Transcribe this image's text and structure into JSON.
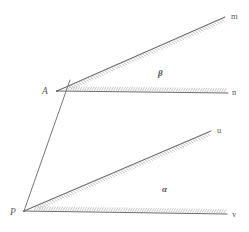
{
  "figure": {
    "kind": "geometry-diagram",
    "background_color": "#ffffff",
    "line_color": "#6d6d70",
    "hatch_color": "#a9a9ad",
    "label_color": "#5c5c60",
    "width": 249,
    "height": 232
  },
  "angles": [
    {
      "id": "upper-angle",
      "name": "beta",
      "label": "β",
      "label_x": 158,
      "label_y": 76,
      "vertex": {
        "label": "A",
        "label_x": 42,
        "label_y": 94,
        "x": 57,
        "y": 91
      },
      "rays": [
        {
          "id": "ray-am",
          "label": "m",
          "label_x": 231,
          "label_y": 19,
          "from_x": 57,
          "from_y": 91,
          "to_x": 225,
          "to_y": 17
        },
        {
          "id": "ray-an",
          "label": "n",
          "label_x": 232,
          "label_y": 95,
          "from_x": 57,
          "from_y": 91,
          "to_x": 228,
          "to_y": 93
        }
      ]
    },
    {
      "id": "lower-angle",
      "name": "alpha",
      "label": "α",
      "label_x": 162,
      "label_y": 192,
      "vertex": {
        "label": "P",
        "label_x": 10,
        "label_y": 215,
        "x": 24,
        "y": 211
      },
      "rays": [
        {
          "id": "ray-pu",
          "label": "u",
          "label_x": 217,
          "label_y": 133,
          "from_x": 24,
          "from_y": 211,
          "to_x": 211,
          "to_y": 131
        },
        {
          "id": "ray-pv",
          "label": "v",
          "label_x": 232,
          "label_y": 217,
          "from_x": 24,
          "from_y": 211,
          "to_x": 227,
          "to_y": 214
        }
      ]
    }
  ],
  "transversal": {
    "id": "transversal-pa",
    "from_x": 24,
    "from_y": 211,
    "to_x": 62,
    "to_y": 103,
    "extend_x": 70,
    "extend_y": 80
  }
}
